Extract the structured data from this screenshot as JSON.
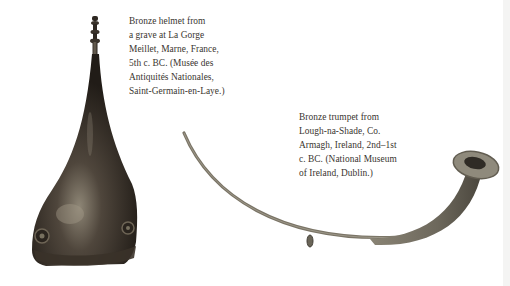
{
  "figures": [
    {
      "id": "helmet",
      "subject": "Bronze helmet",
      "caption_lines": [
        "Bronze helmet from",
        "a grave at La Gorge",
        "Meillet, Marne, France,",
        "5th c. BC. (Musée des",
        "Antiquités Nationales,",
        "Saint-Germain-en-Laye.)"
      ],
      "colors": {
        "dark": "#2a241e",
        "mid": "#5a5046",
        "highlight": "#9a9080"
      }
    },
    {
      "id": "trumpet",
      "subject": "Bronze trumpet",
      "caption_lines": [
        "Bronze trumpet from",
        "Lough-na-Shade, Co.",
        "Armagh, Ireland, 2nd–1st",
        "c. BC. (National Museum",
        "of Ireland, Dublin.)"
      ],
      "colors": {
        "dark": "#3d3a33",
        "mid": "#6f6a5e",
        "highlight": "#a8a394"
      }
    }
  ]
}
